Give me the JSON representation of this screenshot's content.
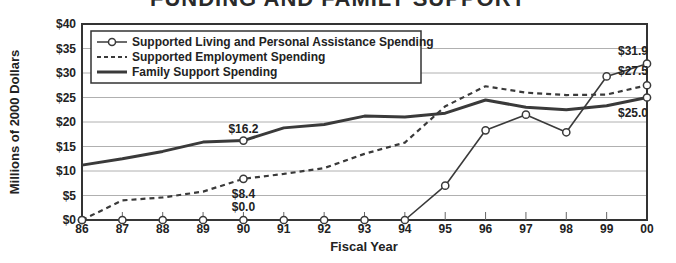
{
  "title": "FUNDING AND FAMILY SUPPORT",
  "chart_data": {
    "type": "line",
    "title": "FUNDING AND FAMILY SUPPORT",
    "xlabel": "Fiscal Year",
    "ylabel": "Millions of 2000 Dollars",
    "categories": [
      "86",
      "87",
      "88",
      "89",
      "90",
      "91",
      "92",
      "93",
      "94",
      "95",
      "96",
      "97",
      "98",
      "99",
      "00"
    ],
    "ylim": [
      0,
      40
    ],
    "yticks": [
      "$0",
      "$5",
      "$10",
      "$15",
      "$20",
      "$25",
      "$30",
      "$35",
      "$40"
    ],
    "grid": true,
    "legend_position": "upper-left",
    "series": [
      {
        "name": "Supported Living and Personal Assistance Spending",
        "style": "solid-thin-with-circle-markers",
        "values": [
          0,
          0,
          0,
          0,
          0,
          0,
          0,
          0,
          0,
          7.0,
          18.3,
          21.5,
          17.9,
          29.3,
          31.9
        ]
      },
      {
        "name": "Supported Employment Spending",
        "style": "dashed",
        "values": [
          0,
          4.0,
          4.6,
          5.8,
          8.4,
          9.4,
          10.6,
          13.5,
          15.8,
          23.2,
          27.3,
          26.0,
          25.5,
          25.6,
          27.5
        ]
      },
      {
        "name": "Family Support Spending",
        "style": "solid-thick",
        "values": [
          11.2,
          12.5,
          14.0,
          15.9,
          16.2,
          18.8,
          19.5,
          21.2,
          21.0,
          21.8,
          24.5,
          23.0,
          22.5,
          23.3,
          25.0
        ]
      }
    ],
    "annotations": [
      {
        "text": "$16.2",
        "x": "90",
        "series": "Family Support Spending"
      },
      {
        "text": "$8.4",
        "x": "90",
        "series": "Supported Employment Spending"
      },
      {
        "text": "$0.0",
        "x": "90",
        "series": "Supported Living and Personal Assistance Spending"
      },
      {
        "text": "$31.9",
        "x": "00",
        "series": "Supported Living and Personal Assistance Spending"
      },
      {
        "text": "$27.5",
        "x": "00",
        "series": "Supported Employment Spending"
      },
      {
        "text": "$25.0",
        "x": "00",
        "series": "Family Support Spending"
      }
    ]
  },
  "legend": {
    "items": [
      "Supported Living and Personal Assistance Spending",
      "Supported Employment Spending",
      "Family Support Spending"
    ]
  },
  "colors": {
    "line": "#3a3a3a",
    "grid": "#b0b0b0",
    "frame": "#333333"
  }
}
